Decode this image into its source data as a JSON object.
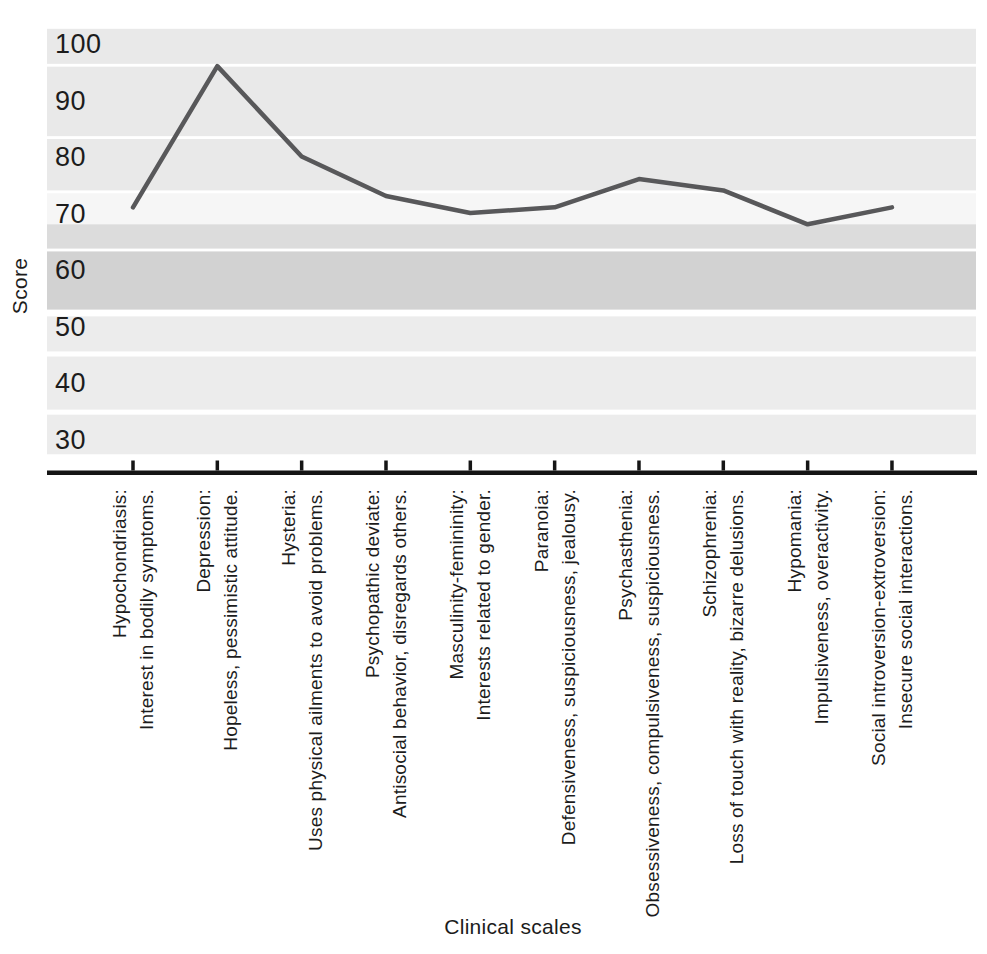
{
  "chart_data": {
    "type": "line",
    "title": "",
    "xlabel": "Clinical scales",
    "ylabel": "Score",
    "legend": "none",
    "grid": "horizontal shaded bands",
    "x_tick_labels_rotated": true,
    "yticks": [
      100,
      90,
      80,
      70,
      60,
      50,
      40,
      30
    ],
    "ylim": [
      27,
      103
    ],
    "categories": [
      {
        "name": "Hypochondriasis:",
        "description": "Interest in bodily symptoms."
      },
      {
        "name": "Depression:",
        "description": "Hopeless, pessimistic attitude."
      },
      {
        "name": "Hysteria:",
        "description": "Uses physical ailments to avoid problems."
      },
      {
        "name": "Psychopathic deviate:",
        "description": "Antisocial behavior, disregards others."
      },
      {
        "name": "Masculinity-femininity:",
        "description": "Interests related to gender."
      },
      {
        "name": "Paranoia:",
        "description": "Defensiveness, suspiciousness, jealousy."
      },
      {
        "name": "Psychasthenia:",
        "description": "Obsessiveness, compulsiveness, suspiciousness."
      },
      {
        "name": "Schizophrenia:",
        "description": "Loss of touch with reality, bizarre delusions."
      },
      {
        "name": "Hypomania:",
        "description": "Impulsiveness, overactivity."
      },
      {
        "name": "Social introversion-extroversion:",
        "description": "Insecure social interactions."
      }
    ],
    "values": [
      71,
      96,
      80,
      73,
      70,
      71,
      76,
      74,
      68,
      71
    ],
    "line_color": "#58585a",
    "axis_color": "#151515",
    "text_color": "#1c1c1c",
    "background_bands": [
      {
        "from": 96.4,
        "to": 102.6,
        "color": "#e9e9e9"
      },
      {
        "from": 83.6,
        "to": 95.9,
        "color": "#e9e9e9"
      },
      {
        "from": 74.0,
        "to": 83.1,
        "color": "#e9e9e9"
      },
      {
        "from": 68.0,
        "to": 73.5,
        "color": "#f6f6f6"
      },
      {
        "from": 63.7,
        "to": 68.0,
        "color": "#dcdcdc"
      },
      {
        "from": 52.9,
        "to": 63.2,
        "color": "#d2d2d2"
      },
      {
        "from": 45.5,
        "to": 51.7,
        "color": "#ececec"
      },
      {
        "from": 35.2,
        "to": 44.6,
        "color": "#ececec"
      },
      {
        "from": 27.3,
        "to": 34.3,
        "color": "#ececec"
      }
    ]
  }
}
